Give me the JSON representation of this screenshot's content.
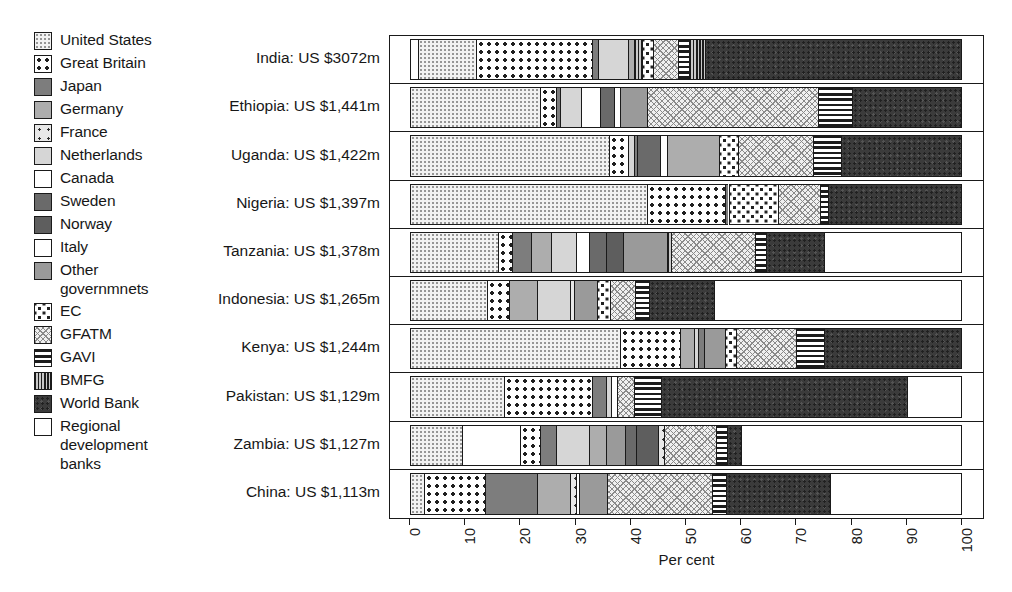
{
  "legend": {
    "items": [
      {
        "label": "United States",
        "pattern": "fine-dots-light"
      },
      {
        "label": "Great Britain",
        "pattern": "bold-dots"
      },
      {
        "label": "Japan",
        "pattern": "solid-mid-dark"
      },
      {
        "label": "Germany",
        "pattern": "solid-mid"
      },
      {
        "label": "France",
        "pattern": "sparse-dots"
      },
      {
        "label": "Netherlands",
        "pattern": "solid-light"
      },
      {
        "label": "Canada",
        "pattern": "white"
      },
      {
        "label": "Sweden",
        "pattern": "solid-dark"
      },
      {
        "label": "Norway",
        "pattern": "solid-darker"
      },
      {
        "label": "Italy",
        "pattern": "white"
      },
      {
        "label": "Other\ngovernmnets",
        "pattern": "solid-mid-grey"
      },
      {
        "label": "EC",
        "pattern": "checker-dots"
      },
      {
        "label": "GFATM",
        "pattern": "cross-hatch"
      },
      {
        "label": "GAVI",
        "pattern": "horizontal-lines"
      },
      {
        "label": "BMFG",
        "pattern": "vertical-lines"
      },
      {
        "label": "World Bank",
        "pattern": "dark-noise"
      },
      {
        "label": "Regional\ndevelopment\nbanks",
        "pattern": "white"
      }
    ]
  },
  "axis": {
    "title": "Per cent",
    "ticks": [
      0,
      10,
      20,
      30,
      40,
      50,
      60,
      70,
      80,
      90,
      100
    ],
    "min": 0,
    "max": 100
  },
  "chart_data": {
    "type": "bar",
    "orientation": "horizontal",
    "stacked": true,
    "normalized": true,
    "title": "",
    "xlabel": "Per cent",
    "ylabel": "",
    "xlim": [
      0,
      100
    ],
    "grid": false,
    "legend_position": "left",
    "series": [
      {
        "name": "United States",
        "pattern": "fine-dots-light"
      },
      {
        "name": "Great Britain",
        "pattern": "bold-dots"
      },
      {
        "name": "Japan",
        "pattern": "solid-mid-dark"
      },
      {
        "name": "Germany",
        "pattern": "solid-mid"
      },
      {
        "name": "France",
        "pattern": "sparse-dots"
      },
      {
        "name": "Netherlands",
        "pattern": "solid-light"
      },
      {
        "name": "Canada",
        "pattern": "white"
      },
      {
        "name": "Sweden",
        "pattern": "solid-dark"
      },
      {
        "name": "Norway",
        "pattern": "solid-darker"
      },
      {
        "name": "Italy",
        "pattern": "white"
      },
      {
        "name": "Other governmnets",
        "pattern": "solid-mid-grey"
      },
      {
        "name": "EC",
        "pattern": "checker-dots"
      },
      {
        "name": "GFATM",
        "pattern": "cross-hatch"
      },
      {
        "name": "GAVI",
        "pattern": "horizontal-lines"
      },
      {
        "name": "BMFG",
        "pattern": "vertical-lines"
      },
      {
        "name": "World Bank",
        "pattern": "dark-noise"
      },
      {
        "name": "Regional development banks",
        "pattern": "white"
      }
    ],
    "categories": [
      "India: US $3072m",
      "Ethiopia: US $1,441m",
      "Uganda: US $1,422m",
      "Nigeria: US $1,397m",
      "Tanzania: US $1,378m",
      "Indonesia: US $1,265m",
      "Kenya: US $1,244m",
      "Pakistan: US $1,129m",
      "Zambia: US $1,127m",
      "China: US $1,113m"
    ],
    "bars": [
      {
        "category": "India: US $3072m",
        "segments": [
          {
            "series": "Canada",
            "value": 1.5
          },
          {
            "series": "United States",
            "value": 10.5
          },
          {
            "series": "Great Britain",
            "value": 21.0
          },
          {
            "series": "Japan",
            "value": 1.0
          },
          {
            "series": "Netherlands",
            "value": 5.5
          },
          {
            "series": "Germany",
            "value": 1.0
          },
          {
            "series": "BMFG",
            "value": 1.5
          },
          {
            "series": "EC",
            "value": 2.0
          },
          {
            "series": "GFATM",
            "value": 4.5
          },
          {
            "series": "GAVI",
            "value": 2.0
          },
          {
            "series": "BMFG",
            "value": 3.0
          },
          {
            "series": "World Bank",
            "value": 46.5
          }
        ]
      },
      {
        "category": "Ethiopia: US $1,441m",
        "segments": [
          {
            "series": "United States",
            "value": 23.5
          },
          {
            "series": "Great Britain",
            "value": 3.0
          },
          {
            "series": "Japan",
            "value": 0.7
          },
          {
            "series": "Netherlands",
            "value": 3.8
          },
          {
            "series": "Canada",
            "value": 3.5
          },
          {
            "series": "Sweden",
            "value": 2.5
          },
          {
            "series": "Italy",
            "value": 1.0
          },
          {
            "series": "Other governmnets",
            "value": 5.0
          },
          {
            "series": "GFATM",
            "value": 31.0
          },
          {
            "series": "GAVI",
            "value": 6.0
          },
          {
            "series": "World Bank",
            "value": 20.0
          }
        ]
      },
      {
        "category": "Uganda: US $1,422m",
        "segments": [
          {
            "series": "United States",
            "value": 36.0
          },
          {
            "series": "Great Britain",
            "value": 3.5
          },
          {
            "series": "Netherlands",
            "value": 1.0
          },
          {
            "series": "Japan",
            "value": 0.7
          },
          {
            "series": "Sweden",
            "value": 4.0
          },
          {
            "series": "Canada",
            "value": 1.3
          },
          {
            "series": "Germany",
            "value": 9.5
          },
          {
            "series": "EC",
            "value": 3.5
          },
          {
            "series": "GFATM",
            "value": 13.5
          },
          {
            "series": "GAVI",
            "value": 5.0
          },
          {
            "series": "World Bank",
            "value": 22.0
          }
        ]
      },
      {
        "category": "Nigeria: US $1,397m",
        "segments": [
          {
            "series": "United States",
            "value": 43.0
          },
          {
            "series": "Great Britain",
            "value": 14.0
          },
          {
            "series": "Japan",
            "value": 0.7
          },
          {
            "series": "EC",
            "value": 9.0
          },
          {
            "series": "GFATM",
            "value": 7.5
          },
          {
            "series": "GAVI",
            "value": 1.5
          },
          {
            "series": "World Bank",
            "value": 24.3
          }
        ]
      },
      {
        "category": "Tanzania: US $1,378m",
        "segments": [
          {
            "series": "United States",
            "value": 16.0
          },
          {
            "series": "Great Britain",
            "value": 2.5
          },
          {
            "series": "Japan",
            "value": 3.5
          },
          {
            "series": "Germany",
            "value": 3.5
          },
          {
            "series": "Netherlands",
            "value": 4.5
          },
          {
            "series": "Canada",
            "value": 2.5
          },
          {
            "series": "Sweden",
            "value": 3.0
          },
          {
            "series": "Norway",
            "value": 3.0
          },
          {
            "series": "Other governmnets",
            "value": 8.0
          },
          {
            "series": "BMFG",
            "value": 0.8
          },
          {
            "series": "GFATM",
            "value": 15.2
          },
          {
            "series": "GAVI",
            "value": 2.0
          },
          {
            "series": "World Bank",
            "value": 10.5
          },
          {
            "series": "Regional development banks",
            "value": 25.0
          }
        ]
      },
      {
        "category": "Indonesia: US $1,265m",
        "segments": [
          {
            "series": "United States",
            "value": 14.0
          },
          {
            "series": "Great Britain",
            "value": 4.0
          },
          {
            "series": "Germany",
            "value": 5.0
          },
          {
            "series": "Netherlands",
            "value": 6.0
          },
          {
            "series": "France",
            "value": 0.8
          },
          {
            "series": "Other governmnets",
            "value": 4.0
          },
          {
            "series": "EC",
            "value": 2.5
          },
          {
            "series": "GFATM",
            "value": 4.5
          },
          {
            "series": "GAVI",
            "value": 2.5
          },
          {
            "series": "World Bank",
            "value": 11.7
          },
          {
            "series": "Regional development banks",
            "value": 45.0
          }
        ]
      },
      {
        "category": "Kenya: US $1,244m",
        "segments": [
          {
            "series": "United States",
            "value": 38.0
          },
          {
            "series": "Great Britain",
            "value": 11.0
          },
          {
            "series": "Germany",
            "value": 2.5
          },
          {
            "series": "Netherlands",
            "value": 0.7
          },
          {
            "series": "Japan",
            "value": 1.0
          },
          {
            "series": "Other governmnets",
            "value": 3.8
          },
          {
            "series": "EC",
            "value": 2.0
          },
          {
            "series": "GFATM",
            "value": 11.0
          },
          {
            "series": "GAVI",
            "value": 5.0
          },
          {
            "series": "World Bank",
            "value": 25.0
          }
        ]
      },
      {
        "category": "Pakistan: US $1,129m",
        "segments": [
          {
            "series": "United States",
            "value": 17.0
          },
          {
            "series": "Great Britain",
            "value": 16.0
          },
          {
            "series": "Japan",
            "value": 2.5
          },
          {
            "series": "Netherlands",
            "value": 1.0
          },
          {
            "series": "Canada",
            "value": 1.0
          },
          {
            "series": "GFATM",
            "value": 3.0
          },
          {
            "series": "GAVI",
            "value": 5.0
          },
          {
            "series": "World Bank",
            "value": 44.5
          },
          {
            "series": "Regional development banks",
            "value": 10.0
          }
        ]
      },
      {
        "category": "Zambia: US $1,127m",
        "segments": [
          {
            "series": "United States",
            "value": 9.5
          },
          {
            "series": "Canada",
            "value": 10.5
          },
          {
            "series": "Great Britain",
            "value": 3.5
          },
          {
            "series": "Japan",
            "value": 3.0
          },
          {
            "series": "Netherlands",
            "value": 6.0
          },
          {
            "series": "Germany",
            "value": 3.0
          },
          {
            "series": "Other governmnets",
            "value": 3.5
          },
          {
            "series": "Sweden",
            "value": 2.0
          },
          {
            "series": "Norway",
            "value": 4.0
          },
          {
            "series": "France",
            "value": 1.0
          },
          {
            "series": "GFATM",
            "value": 9.5
          },
          {
            "series": "GAVI",
            "value": 2.0
          },
          {
            "series": "World Bank",
            "value": 2.5
          },
          {
            "series": "Regional development banks",
            "value": 40.0
          }
        ]
      },
      {
        "category": "China: US $1,113m",
        "segments": [
          {
            "series": "United States",
            "value": 2.5
          },
          {
            "series": "Great Britain",
            "value": 11.0
          },
          {
            "series": "Japan",
            "value": 9.5
          },
          {
            "series": "Germany",
            "value": 6.0
          },
          {
            "series": "France",
            "value": 1.0
          },
          {
            "series": "Canada",
            "value": 0.7
          },
          {
            "series": "Other governmnets",
            "value": 5.0
          },
          {
            "series": "GFATM",
            "value": 19.0
          },
          {
            "series": "GAVI",
            "value": 2.5
          },
          {
            "series": "World Bank",
            "value": 18.8
          },
          {
            "series": "Regional development banks",
            "value": 24.0
          }
        ]
      }
    ]
  }
}
